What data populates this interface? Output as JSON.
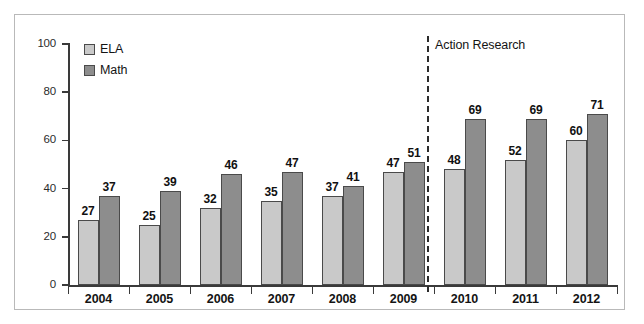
{
  "chart_data": {
    "type": "bar",
    "title": "",
    "subtitle": "",
    "xlabel": "",
    "ylabel": "",
    "ylim": [
      0,
      100
    ],
    "yticks": [
      0,
      20,
      40,
      60,
      80,
      100
    ],
    "ytick_labels": [
      "0",
      "20",
      "40",
      "60",
      "80",
      "100"
    ],
    "grid": false,
    "legend_position": "top-left",
    "categories": [
      "2004",
      "2005",
      "2006",
      "2007",
      "2008",
      "2009",
      "2010",
      "2011",
      "2012"
    ],
    "series": [
      {
        "name": "ELA",
        "color": "#c9c9c9",
        "values": [
          27,
          25,
          32,
          35,
          37,
          47,
          48,
          52,
          60
        ]
      },
      {
        "name": "Math",
        "color": "#8d8d8d",
        "values": [
          37,
          39,
          46,
          47,
          41,
          51,
          69,
          69,
          71
        ]
      }
    ],
    "annotations": [
      {
        "name": "action-research-divider",
        "label": "Action Research",
        "type": "vertical-dashed-line",
        "between_categories": [
          "2009",
          "2010"
        ]
      }
    ]
  },
  "legend": {
    "items": [
      {
        "label": "ELA",
        "color": "#c9c9c9"
      },
      {
        "label": "Math",
        "color": "#8d8d8d"
      }
    ]
  },
  "colors": {
    "ela": "#c9c9c9",
    "math": "#8d8d8d",
    "axis": "#3a3a3a",
    "bar_outline": "#4a4a4a",
    "frame": "#b9b9b9",
    "text": "#141414"
  }
}
